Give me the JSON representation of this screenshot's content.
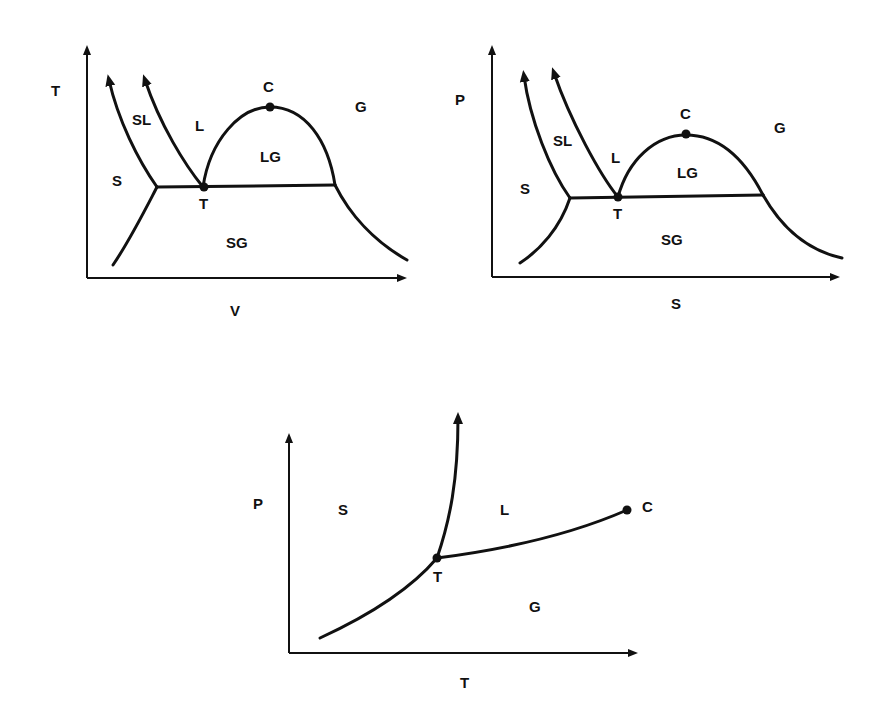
{
  "diagrams": {
    "tv": {
      "title": "",
      "y_axis_label": "T",
      "x_axis_label": "V",
      "regions": {
        "S": "S",
        "SL": "SL",
        "L": "L",
        "LG": "LG",
        "G": "G",
        "SG": "SG"
      },
      "points": {
        "critical": "C",
        "triple": "T"
      }
    },
    "ps": {
      "title": "",
      "y_axis_label": "P",
      "x_axis_label": "S",
      "regions": {
        "S": "S",
        "SL": "SL",
        "L": "L",
        "LG": "LG",
        "G": "G",
        "SG": "SG"
      },
      "points": {
        "critical": "C",
        "triple": "T"
      }
    },
    "pt": {
      "title": "",
      "y_axis_label": "P",
      "x_axis_label": "T",
      "regions": {
        "S": "S",
        "L": "L",
        "G": "G"
      },
      "points": {
        "critical": "C",
        "triple": "T"
      }
    }
  },
  "colors": {
    "ink": "#111111",
    "background": "#ffffff"
  }
}
